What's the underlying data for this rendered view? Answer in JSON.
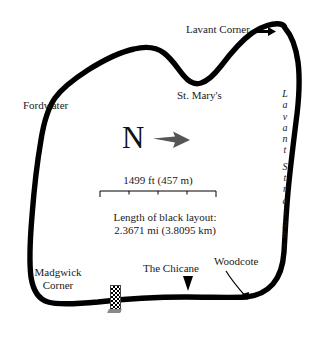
{
  "map": {
    "title": "Goodwood Circuit layout map",
    "background_color": "#ffffff",
    "track_color": "#000000",
    "label_color": "#1a1a1a"
  },
  "corner_labels": {
    "lavant_corner": "Lavant Corner",
    "fordwater": "Fordwater",
    "st_marys": "St. Mary's",
    "madgwick_corner_line1": "Madgwick",
    "madgwick_corner_line2": "Corner",
    "the_chicane": "The Chicane",
    "woodcote": "Woodcote",
    "lavant_straight": "Lavant Straight"
  },
  "compass": {
    "north_letter": "N",
    "arrow_icon": "arrow-right-icon"
  },
  "scale": {
    "caption": "1499 ft (457 m)",
    "segments": 4
  },
  "length": {
    "line1": "Length of black layout:",
    "line2": "2.3671 mi (3.8095 km)",
    "miles": 2.3671,
    "kilometres": 3.8095
  },
  "start_finish": {
    "icon": "checkered-flag-icon",
    "label": ""
  }
}
